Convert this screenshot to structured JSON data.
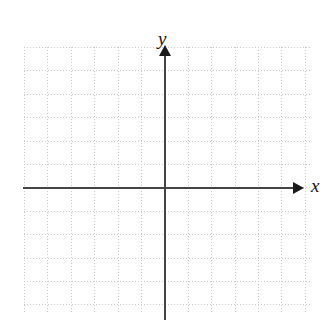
{
  "figure": {
    "kind": "blank-cartesian-coordinate-grid",
    "background_color": "#ffffff",
    "width": 333,
    "height": 333
  },
  "axes": {
    "x_axis": {
      "label": "x",
      "color": "#444444",
      "arrow_direction": "right",
      "arrow_color": "#1b1b1b"
    },
    "y_axis": {
      "label": "y",
      "color": "#444444",
      "arrow_direction": "up",
      "arrow_color": "#1b1b1b"
    },
    "origin": {
      "x": 165,
      "y": 188
    }
  },
  "grid": {
    "style": "dotted",
    "color": "#c9c9c9",
    "cell_size": 23.4,
    "columns": 12,
    "rows": 11,
    "left": 24,
    "top": 47,
    "width": 286,
    "height": 266
  },
  "chart_data": {
    "type": "scatter",
    "title": "",
    "subtitle": "",
    "xlabel": "x",
    "ylabel": "y",
    "series": [
      {
        "name": "",
        "x": [],
        "y": []
      }
    ],
    "xlim": [
      -6,
      6
    ],
    "ylim": [
      -5.5,
      6
    ],
    "xticks": [],
    "yticks": [],
    "xticklabels": [],
    "yticklabels": [],
    "grid": true,
    "grid_style": "dotted",
    "legend": false,
    "legend_position": "none",
    "annotations": []
  }
}
